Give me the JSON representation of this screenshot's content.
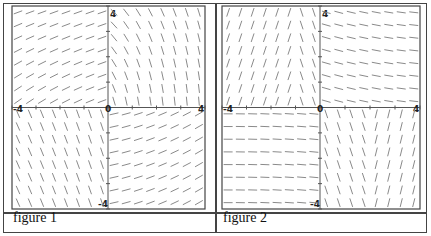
{
  "figures": [
    {
      "caption": "figure 1",
      "xlim": [
        -4,
        4
      ],
      "ylim": [
        -4,
        4
      ],
      "tick_labels": {
        "x_min": "-4",
        "x_max": "4",
        "y_max": "4",
        "y_min": "-4",
        "origin": "0"
      },
      "field": "f1"
    },
    {
      "caption": "figure 2",
      "xlim": [
        -4,
        4
      ],
      "ylim": [
        -4,
        4
      ],
      "tick_labels": {
        "x_min": "-4",
        "x_max": "4",
        "y_max": "4",
        "y_min": "-4",
        "origin": "0"
      },
      "field": "f2"
    }
  ],
  "colors": {
    "border": "#444444",
    "axis": "#555555",
    "segment": "#8a8a8a"
  }
}
